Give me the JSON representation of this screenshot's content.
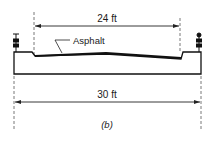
{
  "diagram": {
    "top_dimension": "24 ft",
    "bottom_dimension": "30 ft",
    "material_label": "Asphalt",
    "caption": "(b)"
  }
}
